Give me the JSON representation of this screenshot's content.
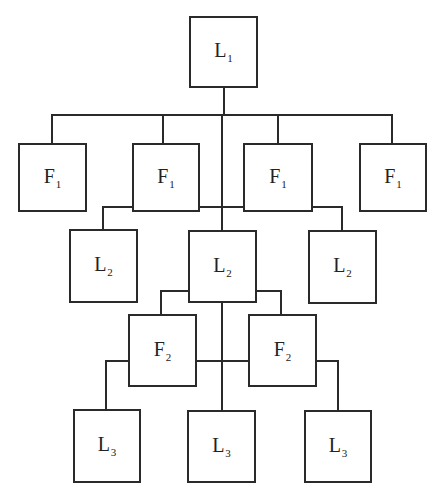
{
  "diagram": {
    "type": "hierarchy",
    "colors": {
      "line": "#2a2a2a",
      "background": "#ffffff",
      "text": "#222222"
    },
    "nodes": [
      {
        "id": "L1",
        "letter": "L",
        "sub": "1",
        "x": 189,
        "y": 16,
        "w": 69,
        "h": 72
      },
      {
        "id": "F1a",
        "letter": "F",
        "sub": "1",
        "x": 18,
        "y": 143,
        "w": 69,
        "h": 69
      },
      {
        "id": "F1b",
        "letter": "F",
        "sub": "1",
        "x": 132,
        "y": 143,
        "w": 68,
        "h": 69
      },
      {
        "id": "F1c",
        "letter": "F",
        "sub": "1",
        "x": 243,
        "y": 143,
        "w": 70,
        "h": 69
      },
      {
        "id": "F1d",
        "letter": "F",
        "sub": "1",
        "x": 359,
        "y": 143,
        "w": 68,
        "h": 69
      },
      {
        "id": "L2a",
        "letter": "L",
        "sub": "2",
        "x": 69,
        "y": 229,
        "w": 69,
        "h": 74
      },
      {
        "id": "L2b",
        "letter": "L",
        "sub": "2",
        "x": 188,
        "y": 230,
        "w": 69,
        "h": 73
      },
      {
        "id": "L2c",
        "letter": "L",
        "sub": "2",
        "x": 308,
        "y": 230,
        "w": 69,
        "h": 74
      },
      {
        "id": "F2a",
        "letter": "F",
        "sub": "2",
        "x": 128,
        "y": 314,
        "w": 69,
        "h": 73
      },
      {
        "id": "F2b",
        "letter": "F",
        "sub": "2",
        "x": 248,
        "y": 314,
        "w": 69,
        "h": 73
      },
      {
        "id": "L3a",
        "letter": "L",
        "sub": "3",
        "x": 73,
        "y": 409,
        "w": 68,
        "h": 74
      },
      {
        "id": "L3b",
        "letter": "L",
        "sub": "3",
        "x": 187,
        "y": 410,
        "w": 69,
        "h": 73
      },
      {
        "id": "L3c",
        "letter": "L",
        "sub": "3",
        "x": 304,
        "y": 410,
        "w": 68,
        "h": 73
      }
    ],
    "edges": [
      [
        "L1",
        "F1a"
      ],
      [
        "L1",
        "F1b"
      ],
      [
        "L1",
        "F1c"
      ],
      [
        "L1",
        "F1d"
      ],
      [
        "L1",
        "L2b"
      ],
      [
        "F1b",
        "L2a"
      ],
      [
        "F1c",
        "L2c"
      ],
      [
        "L2b",
        "F2a"
      ],
      [
        "L2b",
        "F2b"
      ],
      [
        "L2b",
        "L3b"
      ],
      [
        "F2a",
        "L3a"
      ],
      [
        "F2b",
        "L3c"
      ]
    ]
  }
}
